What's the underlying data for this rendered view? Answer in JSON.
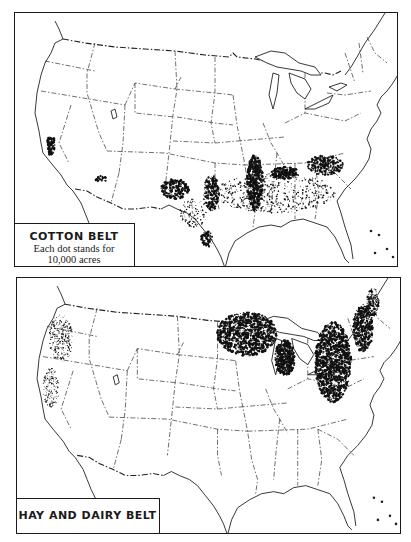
{
  "maps": [
    {
      "id": "cotton",
      "title": "COTTON BELT",
      "subtitle_line1": "Each dot stands for",
      "subtitle_line2": "10,000 acres",
      "dot_value_acres": 10000,
      "concentration_regions": [
        "California Central Valley",
        "Arizona",
        "West Texas / Oklahoma",
        "Mississippi Delta",
        "Alabama",
        "Carolinas",
        "South Texas"
      ]
    },
    {
      "id": "hay-dairy",
      "title": "HAY AND DAIRY BELT",
      "concentration_regions": [
        "Minnesota",
        "Wisconsin",
        "Michigan",
        "New York",
        "Pennsylvania",
        "Vermont",
        "Pacific Northwest"
      ]
    }
  ],
  "colors": {
    "ink": "#1a1a1a",
    "paper": "#ffffff"
  }
}
